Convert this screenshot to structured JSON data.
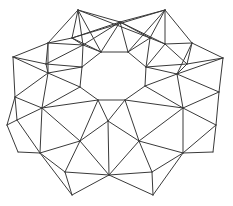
{
  "figure": {
    "type": "wireframe-mesh",
    "stroke_color": "#3a3a3a",
    "background": "#ffffff",
    "width": 233,
    "height": 206
  },
  "vertices": {
    "A": [
      78,
      10
    ],
    "B": [
      165,
      10
    ],
    "C": [
      120,
      22
    ],
    "D": [
      48,
      43
    ],
    "E": [
      72,
      38
    ],
    "F": [
      83,
      45
    ],
    "G": [
      192,
      43
    ],
    "H": [
      165,
      44
    ],
    "I": [
      150,
      38
    ],
    "J": [
      13,
      57
    ],
    "K": [
      223,
      58
    ],
    "L": [
      101,
      52
    ],
    "M": [
      128,
      52
    ],
    "N": [
      82,
      67
    ],
    "O": [
      146,
      67
    ],
    "P": [
      80,
      87
    ],
    "Q": [
      145,
      86
    ],
    "R": [
      98,
      100
    ],
    "S": [
      125,
      100
    ],
    "T": [
      46,
      64
    ],
    "U": [
      187,
      64
    ],
    "V": [
      48,
      73
    ],
    "W": [
      177,
      74
    ],
    "X": [
      15,
      97
    ],
    "Y": [
      42,
      108
    ],
    "Z": [
      7,
      125
    ],
    "AA": [
      17,
      120
    ],
    "AB": [
      219,
      92
    ],
    "AC": [
      183,
      108
    ],
    "AD": [
      216,
      125
    ],
    "AE": [
      213,
      152
    ],
    "AF": [
      108,
      121
    ],
    "AG": [
      80,
      141
    ],
    "AH": [
      139,
      141
    ],
    "AI": [
      18,
      152
    ],
    "AJ": [
      183,
      153
    ],
    "AK": [
      40,
      153
    ],
    "AL": [
      65,
      172
    ],
    "AM": [
      109,
      175
    ],
    "AN": [
      152,
      172
    ],
    "AO": [
      72,
      195
    ],
    "AP": [
      153,
      195
    ]
  },
  "edges": [
    [
      "A",
      "C"
    ],
    [
      "A",
      "E"
    ],
    [
      "A",
      "F"
    ],
    [
      "A",
      "L"
    ],
    [
      "A",
      "D"
    ],
    [
      "A",
      "I"
    ],
    [
      "B",
      "C"
    ],
    [
      "B",
      "G"
    ],
    [
      "B",
      "H"
    ],
    [
      "B",
      "M"
    ],
    [
      "B",
      "I"
    ],
    [
      "B",
      "E"
    ],
    [
      "C",
      "L"
    ],
    [
      "C",
      "M"
    ],
    [
      "C",
      "F"
    ],
    [
      "C",
      "I"
    ],
    [
      "C",
      "E"
    ],
    [
      "C",
      "H"
    ],
    [
      "L",
      "M"
    ],
    [
      "L",
      "F"
    ],
    [
      "M",
      "I"
    ],
    [
      "M",
      "O"
    ],
    [
      "L",
      "N"
    ],
    [
      "D",
      "E"
    ],
    [
      "D",
      "J"
    ],
    [
      "D",
      "T"
    ],
    [
      "D",
      "F"
    ],
    [
      "D",
      "V"
    ],
    [
      "E",
      "F"
    ],
    [
      "F",
      "N"
    ],
    [
      "F",
      "T"
    ],
    [
      "E",
      "L"
    ],
    [
      "H",
      "I"
    ],
    [
      "H",
      "G"
    ],
    [
      "H",
      "O"
    ],
    [
      "H",
      "U"
    ],
    [
      "I",
      "O"
    ],
    [
      "G",
      "K"
    ],
    [
      "G",
      "U"
    ],
    [
      "G",
      "W"
    ],
    [
      "J",
      "T"
    ],
    [
      "J",
      "X"
    ],
    [
      "J",
      "V"
    ],
    [
      "K",
      "U"
    ],
    [
      "K",
      "AB"
    ],
    [
      "K",
      "W"
    ],
    [
      "T",
      "N"
    ],
    [
      "T",
      "V"
    ],
    [
      "V",
      "N"
    ],
    [
      "V",
      "P"
    ],
    [
      "V",
      "X"
    ],
    [
      "V",
      "Y"
    ],
    [
      "U",
      "O"
    ],
    [
      "U",
      "W"
    ],
    [
      "W",
      "O"
    ],
    [
      "W",
      "Q"
    ],
    [
      "W",
      "AB"
    ],
    [
      "W",
      "AC"
    ],
    [
      "N",
      "P"
    ],
    [
      "O",
      "Q"
    ],
    [
      "P",
      "R"
    ],
    [
      "Q",
      "S"
    ],
    [
      "R",
      "S"
    ],
    [
      "P",
      "Y"
    ],
    [
      "Q",
      "AC"
    ],
    [
      "X",
      "Y"
    ],
    [
      "X",
      "Z"
    ],
    [
      "X",
      "AA"
    ],
    [
      "Y",
      "AA"
    ],
    [
      "Y",
      "R"
    ],
    [
      "Y",
      "AG"
    ],
    [
      "Y",
      "AK"
    ],
    [
      "Z",
      "AA"
    ],
    [
      "Z",
      "AI"
    ],
    [
      "AA",
      "AK"
    ],
    [
      "AI",
      "AK"
    ],
    [
      "AB",
      "AC"
    ],
    [
      "AB",
      "AD"
    ],
    [
      "AC",
      "AD"
    ],
    [
      "AC",
      "S"
    ],
    [
      "AC",
      "AH"
    ],
    [
      "AC",
      "AJ"
    ],
    [
      "AD",
      "AE"
    ],
    [
      "AE",
      "AJ"
    ],
    [
      "AD",
      "AJ"
    ],
    [
      "R",
      "AF"
    ],
    [
      "S",
      "AF"
    ],
    [
      "R",
      "AG"
    ],
    [
      "S",
      "AH"
    ],
    [
      "AF",
      "AG"
    ],
    [
      "AF",
      "AH"
    ],
    [
      "AF",
      "AM"
    ],
    [
      "AG",
      "AK"
    ],
    [
      "AG",
      "AL"
    ],
    [
      "AG",
      "AM"
    ],
    [
      "AH",
      "AJ"
    ],
    [
      "AH",
      "AN"
    ],
    [
      "AH",
      "AM"
    ],
    [
      "AK",
      "AL"
    ],
    [
      "AK",
      "AO"
    ],
    [
      "AL",
      "AM"
    ],
    [
      "AL",
      "AO"
    ],
    [
      "AJ",
      "AN"
    ],
    [
      "AJ",
      "AP"
    ],
    [
      "AN",
      "AM"
    ],
    [
      "AN",
      "AP"
    ],
    [
      "AM",
      "AO"
    ],
    [
      "AM",
      "AP"
    ]
  ]
}
